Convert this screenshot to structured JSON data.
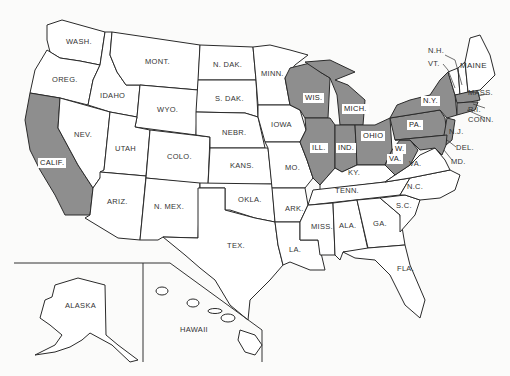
{
  "map": {
    "title": "United States",
    "shade_color": "#8e8e8e",
    "border_color": "#2a2a2a",
    "background": "#fbfbfa",
    "shaded_states": [
      "CALIF.",
      "WIS.",
      "MICH.",
      "ILL.",
      "IND.",
      "OHIO",
      "W. VA.",
      "PA.",
      "N.Y.",
      "N.J.",
      "DEL.",
      "MD.",
      "MASS.",
      "R.I.",
      "CONN."
    ],
    "labels": {
      "wash": "WASH.",
      "oreg": "OREG.",
      "calif": "CALIF.",
      "idaho": "IDAHO",
      "nev": "NEV.",
      "mont": "MONT.",
      "wyo": "WYO.",
      "utah": "UTAH",
      "ariz": "ARIZ.",
      "colo": "COLO.",
      "nmex": "N. MEX.",
      "ndak": "N. DAK.",
      "sdak": "S. DAK.",
      "nebr": "NEBR.",
      "kans": "KANS.",
      "okla": "OKLA.",
      "tex": "TEX.",
      "minn": "MINN.",
      "iowa": "IOWA",
      "mo": "MO.",
      "ark": "ARK.",
      "la": "LA.",
      "wis": "WIS.",
      "mich": "MICH.",
      "ill": "ILL.",
      "ind": "IND.",
      "ohio": "OHIO",
      "ky": "KY.",
      "tenn": "TENN.",
      "miss": "MISS.",
      "ala": "ALA.",
      "ga": "GA.",
      "fla": "FLA.",
      "sc": "S.C.",
      "nc": "N.C.",
      "va": "VA.",
      "wva_w": "W.",
      "wva_va": "VA.",
      "pa": "PA.",
      "ny": "N.Y.",
      "nj": "N.J.",
      "del": "DEL.",
      "md": "MD.",
      "nh": "N.H.",
      "vt": "VT.",
      "maine": "MAINE",
      "mass": "MASS.",
      "ri": "R.I.",
      "conn": "CONN.",
      "alaska": "ALASKA",
      "hawaii": "HAWAII"
    }
  }
}
